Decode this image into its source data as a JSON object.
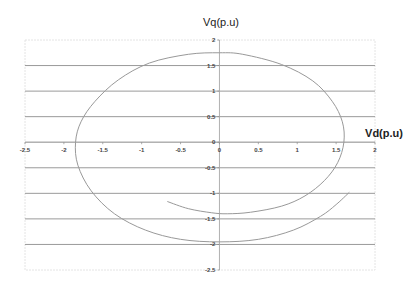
{
  "chart_data": {
    "type": "line",
    "title": "",
    "xlabel": "Vd(p.u)",
    "ylabel": "Vq(p.u)",
    "xlim": [
      -2.5,
      2
    ],
    "ylim": [
      -2.5,
      2
    ],
    "x_ticks": [
      "-2.5",
      "-2",
      "-1.5",
      "-1",
      "-0.5",
      "0",
      "0.5",
      "1",
      "1.5",
      "2"
    ],
    "y_ticks": [
      "2",
      "1.5",
      "1",
      "0.5",
      "0",
      "-0.5",
      "-1",
      "-1.5",
      "-2",
      "-2.5"
    ],
    "grid": {
      "horizontal": true,
      "vertical": false
    },
    "legend": null,
    "series": [
      {
        "name": "Vd-Vq trajectory",
        "color": "#999999",
        "points": [
          [
            -0.67,
            -1.16
          ],
          [
            -0.4,
            -1.3
          ],
          [
            -0.1,
            -1.38
          ],
          [
            0.1,
            -1.4
          ],
          [
            0.4,
            -1.37
          ],
          [
            0.8,
            -1.25
          ],
          [
            1.1,
            -1.05
          ],
          [
            1.35,
            -0.75
          ],
          [
            1.52,
            -0.4
          ],
          [
            1.6,
            0.0
          ],
          [
            1.58,
            0.4
          ],
          [
            1.45,
            0.8
          ],
          [
            1.2,
            1.2
          ],
          [
            0.8,
            1.52
          ],
          [
            0.3,
            1.72
          ],
          [
            0.0,
            1.75
          ],
          [
            -0.4,
            1.72
          ],
          [
            -0.9,
            1.55
          ],
          [
            -1.3,
            1.22
          ],
          [
            -1.6,
            0.8
          ],
          [
            -1.78,
            0.4
          ],
          [
            -1.85,
            0.0
          ],
          [
            -1.82,
            -0.45
          ],
          [
            -1.65,
            -0.95
          ],
          [
            -1.35,
            -1.4
          ],
          [
            -0.95,
            -1.72
          ],
          [
            -0.5,
            -1.9
          ],
          [
            0.0,
            -1.95
          ],
          [
            0.5,
            -1.9
          ],
          [
            0.95,
            -1.72
          ],
          [
            1.3,
            -1.45
          ],
          [
            1.5,
            -1.22
          ],
          [
            1.67,
            -0.98
          ]
        ]
      }
    ]
  }
}
